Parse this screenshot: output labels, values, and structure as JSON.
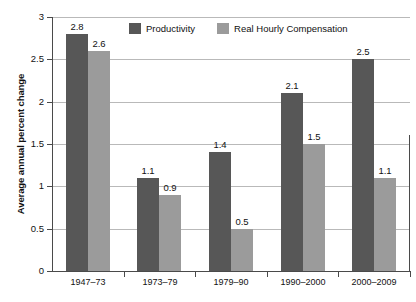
{
  "chart_data": {
    "type": "bar",
    "title": "",
    "xlabel": "",
    "ylabel": "Average annual percent change",
    "ylim": [
      0,
      3
    ],
    "yticks": [
      "0",
      "0.5",
      "1",
      "1.5",
      "2",
      "2.5",
      "3"
    ],
    "grid": true,
    "legend_position": "top-center",
    "categories": [
      "1947–73",
      "1973–79",
      "1979–90",
      "1990–2000",
      "2000–2009"
    ],
    "series": [
      {
        "name": "Productivity",
        "color": "#575757",
        "values": [
          2.8,
          1.1,
          1.4,
          2.1,
          2.5
        ],
        "labels": [
          "2.8",
          "1.1",
          "1.4",
          "2.1",
          "2.5"
        ]
      },
      {
        "name": "Real Hourly Compensation",
        "color": "#9b9b9b",
        "values": [
          2.6,
          0.9,
          0.5,
          1.5,
          1.1
        ],
        "labels": [
          "2.6",
          "0.9",
          "0.5",
          "1.5",
          "1.1"
        ]
      }
    ]
  },
  "axis": {
    "y_title": "Average annual percent change"
  },
  "legend": {
    "items": [
      {
        "label": "Productivity",
        "color": "#575757"
      },
      {
        "label": "Real Hourly Compensation",
        "color": "#9b9b9b"
      }
    ]
  }
}
